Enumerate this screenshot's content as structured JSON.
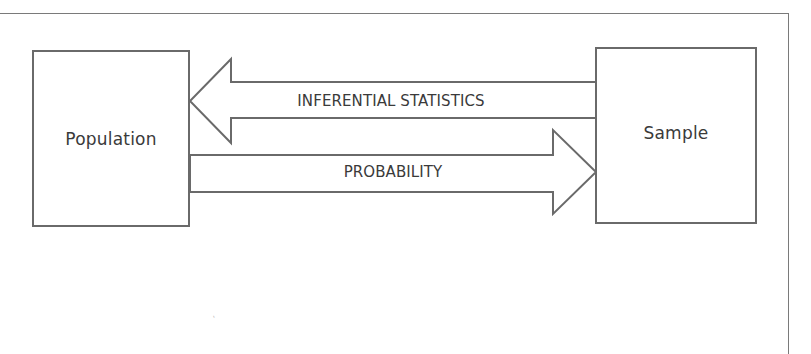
{
  "diagram": {
    "nodes": [
      {
        "id": "population",
        "label": "Population"
      },
      {
        "id": "sample",
        "label": "Sample"
      }
    ],
    "edges": [
      {
        "from": "sample",
        "to": "population",
        "label": "INFERENTIAL STATISTICS",
        "direction": "left"
      },
      {
        "from": "population",
        "to": "sample",
        "label": "PROBABILITY",
        "direction": "right"
      }
    ]
  },
  "colors": {
    "stroke": "#6a6a6a",
    "text": "#3a3a3a",
    "background": "#ffffff"
  }
}
